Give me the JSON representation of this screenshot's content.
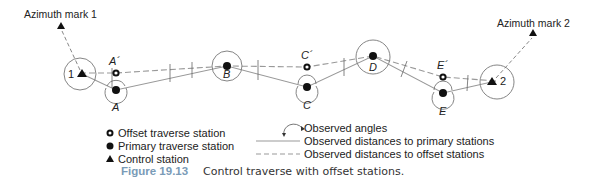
{
  "figure": {
    "number": "Figure 19.13",
    "caption": "Control traverse with offset stations.",
    "colors": {
      "line": "#888888",
      "marker": "#111111",
      "caption_number": "#7a9bb7"
    }
  },
  "azimuth_marks": [
    {
      "id": "az1",
      "label": "Azimuth mark 1"
    },
    {
      "id": "az2",
      "label": "Azimuth mark 2"
    }
  ],
  "control_stations": [
    {
      "id": "s1",
      "label": "1"
    },
    {
      "id": "s2",
      "label": "2"
    }
  ],
  "primary_stations": [
    {
      "id": "A",
      "label": "A"
    },
    {
      "id": "B",
      "label": "B"
    },
    {
      "id": "C",
      "label": "C"
    },
    {
      "id": "D",
      "label": "D"
    },
    {
      "id": "E",
      "label": "E"
    }
  ],
  "offset_stations": [
    {
      "id": "A2",
      "label": "A´"
    },
    {
      "id": "C2",
      "label": "C´"
    },
    {
      "id": "E2",
      "label": "E´"
    }
  ],
  "legend": {
    "offset": "Offset traverse station",
    "primary": "Primary traverse station",
    "control": "Control station",
    "angles": "Observed angles",
    "primary_dist": "Observed distances to primary stations",
    "offset_dist": "Observed distances to offset stations"
  }
}
